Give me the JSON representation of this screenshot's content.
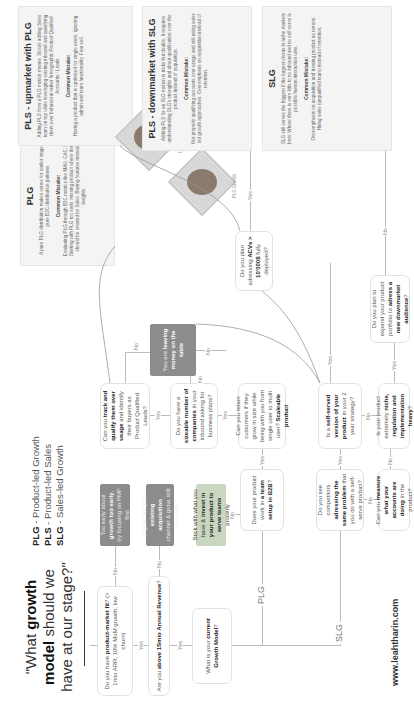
{
  "header": {
    "title_pre": "\"What ",
    "title_bold": "growth model",
    "title_post": " should we have at our stage?\"",
    "legend": [
      {
        "abbr": "PLG",
        "text": " - Product-led Growth"
      },
      {
        "abbr": "PLS",
        "text": " - Product-led Sales"
      },
      {
        "abbr": "SLG",
        "text": " - Sales-led Growth"
      }
    ]
  },
  "nodes": {
    "pmf": {
      "pre": "Do you have ",
      "bold": "product-market fit",
      "post": "? (> 1mio ARR, 10% MoM growth, low churn)"
    },
    "pmf_no": {
      "pre": "Too early about ",
      "bold": "growth too early",
      "post": ", try focusing on PMF first"
    },
    "revenue": {
      "pre": "Are you ",
      "bold": "above 1Smio Annual Revenue",
      "post": "?"
    },
    "revenue_no": {
      "pre": "Figure out your ",
      "bold": "existing acquisition",
      "post": " channel & grow, still too early"
    },
    "current_model": {
      "pre": "What is your ",
      "bold": "current Growth Model",
      "post": "?"
    },
    "stick": {
      "pre": "Stick with what you have & ",
      "bold": "invest in your product to serve teams",
      "post": " properly"
    },
    "b2b_team": {
      "pre": "Does your product work in ",
      "bold": "a team setup in B2B",
      "post": "?"
    },
    "sizeable": {
      "pre": "Do you have a ",
      "bold": "sizeable number of companies",
      "post": " in your inbound asking for business plans?"
    },
    "track": {
      "pre": "Can you ",
      "bold": "track and qualify them over usage",
      "post": " and identify their buyers as Product Qualified Leads?"
    },
    "money": {
      "pre": "You are ",
      "bold": "leaving money on the table",
      "post": ""
    },
    "retain": {
      "pre": "Can you retain customers if they grow in size while being with you from single user to multi user? ",
      "bold": "Scaleable product",
      "post": ""
    },
    "acv": {
      "pre": "Do you plan adressing ",
      "bold": "ACVs > 10'000$",
      "post": " fully deployed?"
    },
    "competitors": {
      "pre": "Do you see competitors ",
      "bold": "adressing the same problem",
      "post": " that you do with a self-serve product?"
    },
    "self_served": {
      "pre": "Is a ",
      "bold": "self-served version of your product",
      "post": " in your 2 year strategy?"
    },
    "measure": {
      "pre": "Can you ",
      "bold": "measure what your accounts are doing",
      "post": " in the product?"
    },
    "niche": {
      "pre": "Is your product extremely ",
      "bold": "niche, regulation and implementation heavy",
      "post": "?"
    },
    "downmarket": {
      "pre": "Do you plan to expand your product portfolio to ",
      "bold": "adress a new downmarket audience",
      "post": "?"
    }
  },
  "outcomes": {
    "plg": {
      "title": "PLG",
      "desc": "A pure PLG distribution makes sense for earlier stage and pure B2C distribution patterns",
      "mistake_title": "Common Mistake:",
      "mistake": "Evaluating PLG through B2C metrics like MAU, CAC, NPS. Starting with PLG too early, missing product where demand should be created by Sales. Buying features instead of insights."
    },
    "pls_up": {
      "title": "PLS - upmarket with PLG",
      "desc": "Adding PLS from a PLG motion means: Slowly adding Sales team on top while leveraging existing inbound and qualifying them over behavioral rather firmographic Product Qualified Accounts / Leads",
      "mistake_title": "Common Mistake:",
      "mistake": "Having a product that is optimised for single users, ignoring admin and team functionality. Fear sell."
    },
    "pls_down": {
      "title": "PLS - downmarket with SLG",
      "desc": "Adding PLS for an SLG motion is tricky but doable. It requires understanding SLG's strengths and about qualification over the product instead of acquisition.",
      "mistake_title": "Common Mistake:",
      "mistake": "Not properly qualifying accounts over usage and still using sales led growth approaches. Overemphasis on acquisition instead of retention."
    },
    "slg": {
      "title": "SLG",
      "desc": "SLG still serves the biggest if the largest clients in niche markets best. Where there is very little to no inbound and no self-serve is possible human interaction wins.",
      "mistake_title": "Common Mistake:",
      "mistake": "Overemphasis on acquisition and treating product as remote. Hiring sales (unqualified team) instead of retention."
    }
  },
  "labels": {
    "yes": "Yes",
    "no": "No",
    "plg": "PLG",
    "slg": "SLG"
  },
  "people": [
    {
      "caption": "Leah Tharin"
    },
    {
      "caption": "PLS Growth"
    }
  ],
  "footer": {
    "url": "www.leahtharin.com"
  }
}
